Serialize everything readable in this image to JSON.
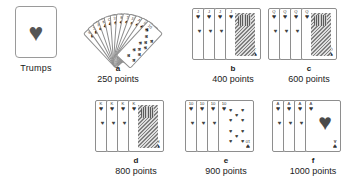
{
  "figure": {
    "background": "#ffffff",
    "ink": "#1a1a1a"
  },
  "trumps": {
    "label": "Trumps",
    "suit_symbol": "♥",
    "suit_name": "hearts",
    "icon": "heart-icon"
  },
  "glyphs": {
    "heart": "♥",
    "spade": "♠",
    "club": "♣",
    "diamond": "♦"
  },
  "groups": [
    {
      "id": "a",
      "letter": "a",
      "points": "250 points",
      "points_value": 250,
      "layout": "fan",
      "card_count": 12,
      "cards": [
        {
          "rank": "9",
          "suit": "♣"
        },
        {
          "rank": "J",
          "suit": "♣"
        },
        {
          "rank": "A",
          "suit": "♠"
        },
        {
          "rank": "K",
          "suit": "♣"
        },
        {
          "rank": "Q",
          "suit": "♣"
        },
        {
          "rank": "10",
          "suit": "♠"
        },
        {
          "rank": "8",
          "suit": "♠"
        },
        {
          "rank": "7",
          "suit": "♠"
        },
        {
          "rank": "10",
          "suit": "♠"
        },
        {
          "rank": "A",
          "suit": "♠"
        },
        {
          "rank": "9",
          "suit": "♣"
        },
        {
          "rank": "10",
          "suit": "♣"
        }
      ]
    },
    {
      "id": "b",
      "letter": "b",
      "points": "400 points",
      "points_value": 400,
      "layout": "stack",
      "card_count": 4,
      "cards": [
        {
          "rank": "J",
          "suit": "♥",
          "face": false
        },
        {
          "rank": "J",
          "suit": "♥",
          "face": false
        },
        {
          "rank": "J",
          "suit": "♥",
          "face": false
        },
        {
          "rank": "J",
          "suit": "♥",
          "face": true
        }
      ]
    },
    {
      "id": "c",
      "letter": "c",
      "points": "600 points",
      "points_value": 600,
      "layout": "stack",
      "card_count": 4,
      "cards": [
        {
          "rank": "Q",
          "suit": "♥",
          "face": false
        },
        {
          "rank": "Q",
          "suit": "♥",
          "face": false
        },
        {
          "rank": "Q",
          "suit": "♥",
          "face": false
        },
        {
          "rank": "Q",
          "suit": "♥",
          "face": true
        }
      ]
    },
    {
      "id": "d",
      "letter": "d",
      "points": "800 points",
      "points_value": 800,
      "layout": "stack",
      "card_count": 4,
      "cards": [
        {
          "rank": "K",
          "suit": "♥",
          "face": false
        },
        {
          "rank": "K",
          "suit": "♥",
          "face": false
        },
        {
          "rank": "K",
          "suit": "♥",
          "face": false
        },
        {
          "rank": "K",
          "suit": "♥",
          "face": true
        }
      ]
    },
    {
      "id": "e",
      "letter": "e",
      "points": "900 points",
      "points_value": 900,
      "layout": "stack",
      "card_count": 4,
      "cards": [
        {
          "rank": "10",
          "suit": "♥",
          "face": false
        },
        {
          "rank": "10",
          "suit": "♥",
          "face": false
        },
        {
          "rank": "10",
          "suit": "♥",
          "face": false
        },
        {
          "rank": "10",
          "suit": "♥",
          "face": false,
          "pips": 10
        }
      ]
    },
    {
      "id": "f",
      "letter": "f",
      "points": "1000 points",
      "points_value": 1000,
      "layout": "stack",
      "card_count": 4,
      "cards": [
        {
          "rank": "A",
          "suit": "♥",
          "face": false
        },
        {
          "rank": "A",
          "suit": "♥",
          "face": false
        },
        {
          "rank": "A",
          "suit": "♥",
          "face": false
        },
        {
          "rank": "A",
          "suit": "♥",
          "face": false,
          "pips": 1
        }
      ]
    }
  ]
}
